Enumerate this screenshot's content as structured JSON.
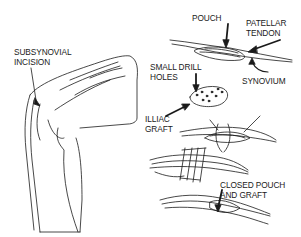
{
  "figure": {
    "colors": {
      "ink": "#1a1a1a",
      "background": "#ffffff"
    },
    "labels": {
      "subsynovial_incision": [
        "SUBSYNOVIAL",
        "INCISION"
      ],
      "pouch": "POUCH",
      "patellar_tendon": [
        "PATELLAR",
        "TENDON"
      ],
      "synovium": "SYNOVIUM",
      "small_drill_holes": [
        "SMALL DRILL",
        "HOLES"
      ],
      "iliac_graft": [
        "ILLIAC",
        "GRAFT"
      ],
      "closed_pouch_and_graft": [
        "CLOSED POUCH",
        "AND GRAFT"
      ]
    }
  }
}
